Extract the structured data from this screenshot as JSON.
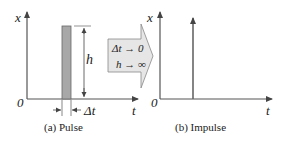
{
  "panel_a": {
    "y_axis_label": "x",
    "x_axis_label": "t",
    "origin_label": "0",
    "height_label": "h",
    "width_label": "Δt",
    "caption": "(a)  Pulse"
  },
  "transition": {
    "line1": "Δt → 0",
    "line2": "h → ∞"
  },
  "panel_b": {
    "y_axis_label": "x",
    "x_axis_label": "t",
    "origin_label": "0",
    "caption": "(b) Impulse"
  },
  "colors": {
    "axis": "#555555",
    "pulse_fill": "#a8a8a8",
    "arrow_fill": "#e6e6e6",
    "arrow_stroke": "#888888"
  }
}
